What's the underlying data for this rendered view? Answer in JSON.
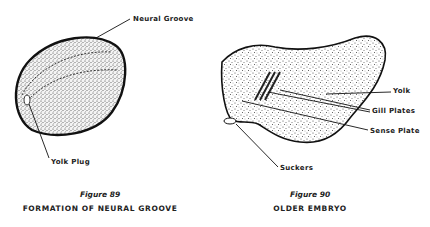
{
  "figures": [
    {
      "number": "Figure 89",
      "caption": "FORMATION OF NEURAL GROOVE",
      "labels": {
        "neural_groove": "Neural Groove",
        "yolk_plug": "Yolk Plug"
      }
    },
    {
      "number": "Figure 90",
      "caption": "OLDER EMBRYO",
      "labels": {
        "yolk": "Yolk",
        "gill_plates": "Gill Plates",
        "sense_plate": "Sense Plate",
        "suckers": "Suckers"
      }
    }
  ],
  "colors": {
    "ink": "#1a1a1a",
    "paper": "#ffffff",
    "stipple": "#555555"
  }
}
